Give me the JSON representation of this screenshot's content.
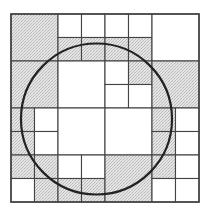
{
  "diagram": {
    "type": "quadtree-circle-approximation",
    "colors": {
      "background": "#ffffff",
      "shaded_fill": "#dcdcdc",
      "grid_line": "#444444",
      "circle_stroke": "#222222"
    },
    "grid": {
      "x0": 11,
      "y0": 14,
      "size": 188,
      "divisions": 8
    },
    "circle": {
      "cx": 96.5,
      "cy": 119,
      "r": 75.5
    },
    "cells": [
      {
        "c": 0,
        "r": 0,
        "s": 2,
        "shaded": true
      },
      {
        "c": 2,
        "r": 0,
        "s": 1,
        "shaded": false
      },
      {
        "c": 3,
        "r": 0,
        "s": 1,
        "shaded": false
      },
      {
        "c": 4,
        "r": 0,
        "s": 1,
        "shaded": false
      },
      {
        "c": 5,
        "r": 0,
        "s": 1,
        "shaded": false
      },
      {
        "c": 2,
        "r": 1,
        "s": 1,
        "shaded": true
      },
      {
        "c": 3,
        "r": 1,
        "s": 1,
        "shaded": true
      },
      {
        "c": 4,
        "r": 1,
        "s": 1,
        "shaded": true
      },
      {
        "c": 5,
        "r": 1,
        "s": 1,
        "shaded": true
      },
      {
        "c": 6,
        "r": 0,
        "s": 2,
        "shaded": false
      },
      {
        "c": 0,
        "r": 2,
        "s": 2,
        "shaded": true
      },
      {
        "c": 2,
        "r": 2,
        "s": 2,
        "shaded": false
      },
      {
        "c": 4,
        "r": 2,
        "s": 1,
        "shaded": false
      },
      {
        "c": 5,
        "r": 2,
        "s": 1,
        "shaded": true
      },
      {
        "c": 4,
        "r": 3,
        "s": 1,
        "shaded": false
      },
      {
        "c": 5,
        "r": 3,
        "s": 1,
        "shaded": false
      },
      {
        "c": 6,
        "r": 2,
        "s": 2,
        "shaded": true
      },
      {
        "c": 0,
        "r": 4,
        "s": 1,
        "shaded": true
      },
      {
        "c": 1,
        "r": 4,
        "s": 1,
        "shaded": false
      },
      {
        "c": 0,
        "r": 5,
        "s": 1,
        "shaded": true
      },
      {
        "c": 1,
        "r": 5,
        "s": 1,
        "shaded": false
      },
      {
        "c": 2,
        "r": 4,
        "s": 2,
        "shaded": false
      },
      {
        "c": 4,
        "r": 4,
        "s": 2,
        "shaded": false
      },
      {
        "c": 6,
        "r": 4,
        "s": 1,
        "shaded": true
      },
      {
        "c": 7,
        "r": 4,
        "s": 1,
        "shaded": false
      },
      {
        "c": 6,
        "r": 5,
        "s": 1,
        "shaded": true
      },
      {
        "c": 7,
        "r": 5,
        "s": 1,
        "shaded": false
      },
      {
        "c": 0,
        "r": 6,
        "s": 1,
        "shaded": true
      },
      {
        "c": 1,
        "r": 6,
        "s": 1,
        "shaded": true
      },
      {
        "c": 0,
        "r": 7,
        "s": 1,
        "shaded": false
      },
      {
        "c": 1,
        "r": 7,
        "s": 1,
        "shaded": true
      },
      {
        "c": 2,
        "r": 6,
        "s": 1,
        "shaded": false
      },
      {
        "c": 3,
        "r": 6,
        "s": 1,
        "shaded": false
      },
      {
        "c": 2,
        "r": 7,
        "s": 1,
        "shaded": true
      },
      {
        "c": 3,
        "r": 7,
        "s": 1,
        "shaded": true
      },
      {
        "c": 4,
        "r": 6,
        "s": 2,
        "shaded": true
      },
      {
        "c": 6,
        "r": 6,
        "s": 1,
        "shaded": true
      },
      {
        "c": 7,
        "r": 6,
        "s": 1,
        "shaded": false
      },
      {
        "c": 6,
        "r": 7,
        "s": 1,
        "shaded": false
      },
      {
        "c": 7,
        "r": 7,
        "s": 1,
        "shaded": false
      }
    ]
  }
}
